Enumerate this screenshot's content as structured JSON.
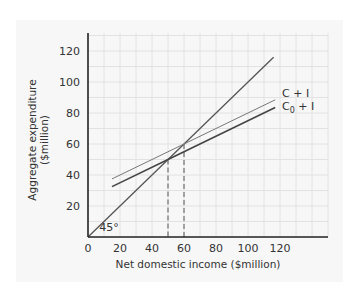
{
  "chart_data": {
    "type": "line",
    "title": "",
    "xlabel": "Net domestic income ($million)",
    "ylabel_line1": "Aggregate expenditure",
    "ylabel_line2": "($million)",
    "xlim": [
      0,
      150
    ],
    "ylim": [
      0,
      130
    ],
    "x_ticks": [
      0,
      20,
      40,
      60,
      80,
      100,
      120
    ],
    "y_ticks": [
      20,
      40,
      60,
      80,
      100,
      120
    ],
    "grid": true,
    "grid_step": 10,
    "series": [
      {
        "name": "45° line",
        "label": "45°",
        "x": [
          0,
          116
        ],
        "y": [
          0,
          116
        ],
        "color": "#555555",
        "width": 1.3
      },
      {
        "name": "C + I",
        "label": "C + I",
        "x": [
          15,
          60,
          117
        ],
        "y": [
          37.5,
          60,
          88.5
        ],
        "color": "#777777",
        "width": 1
      },
      {
        "name": "C0 + I",
        "label": "C",
        "label_sub": "0",
        "label_rest": " + I",
        "x": [
          15,
          50,
          117
        ],
        "y": [
          32.5,
          50,
          83.5
        ],
        "color": "#444444",
        "width": 1.6
      }
    ],
    "equilibria": [
      {
        "x": 50,
        "y": 50,
        "series": "C0 + I"
      },
      {
        "x": 60,
        "y": 60,
        "series": "C + I"
      }
    ],
    "annotations": [
      {
        "text": "45°",
        "x": 7,
        "y": 4
      }
    ]
  }
}
